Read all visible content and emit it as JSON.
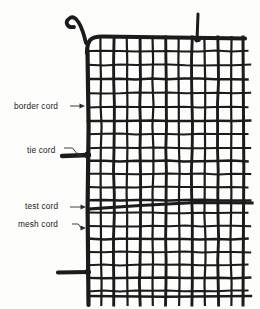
{
  "figure": {
    "kind": "technical-line-drawing",
    "background_color": "#fdfdfb",
    "ink_color": "#1b1b1b",
    "width": 260,
    "height": 309
  },
  "labels": [
    {
      "id": "border-cord",
      "text": "border cord",
      "text_x": 14,
      "text_y": 101,
      "arrow_from_x": 70,
      "arrow_from_y": 106,
      "arrow_to_x": 85,
      "arrow_to_y": 106,
      "arrow_style": "straight"
    },
    {
      "id": "tie-cord",
      "text": "tie cord",
      "text_x": 27,
      "text_y": 145,
      "arrow_from_x": 64,
      "arrow_from_y": 148,
      "arrow_to_x": 83,
      "arrow_to_y": 155,
      "arrow_style": "elbow-down"
    },
    {
      "id": "test-cord",
      "text": "test cord",
      "text_x": 25,
      "text_y": 201,
      "arrow_from_x": 70,
      "arrow_from_y": 207,
      "arrow_to_x": 86,
      "arrow_to_y": 207,
      "arrow_style": "straight"
    },
    {
      "id": "mesh-cord",
      "text": "mesh cord",
      "text_x": 18,
      "text_y": 219,
      "arrow_from_x": 72,
      "arrow_from_y": 224,
      "arrow_to_x": 86,
      "arrow_to_y": 228,
      "arrow_style": "elbow-down"
    }
  ],
  "net_geometry": {
    "panel_left": 88,
    "panel_right": 243,
    "panel_top": 37,
    "panel_bottom": 296,
    "border_cord_width": 4.2,
    "mesh_cord_width": 2.0,
    "test_cord_width": 3.2,
    "vertical_cord_count": 12,
    "horizontal_cord_count": 18,
    "vertical_cord_x": [
      88,
      101,
      114,
      127,
      140,
      153,
      166,
      179,
      192,
      205,
      218,
      231,
      243
    ],
    "horizontal_cord_y": [
      37,
      51,
      65,
      79,
      93,
      107,
      121,
      134,
      148,
      161,
      174,
      187,
      200,
      213,
      226,
      239,
      252,
      265,
      278,
      291
    ],
    "test_cord_y_left": 209,
    "test_cord_y_right": 203,
    "top_hook": {
      "x": 66,
      "y": 16,
      "description": "curved cord hook at upper-left corner"
    },
    "top_tie": {
      "x": 197,
      "y": 14,
      "description": "vertical tie cord stub rising from top border"
    },
    "left_tie_upper": {
      "x": 70,
      "y": 155,
      "description": "horizontal tie cord stub on left border"
    },
    "left_tie_lower": {
      "x": 66,
      "y": 272,
      "description": "horizontal tie cord stub on left border near bottom"
    },
    "bottom_fringe_y": 296,
    "bottom_fringe_overhang": 9
  }
}
